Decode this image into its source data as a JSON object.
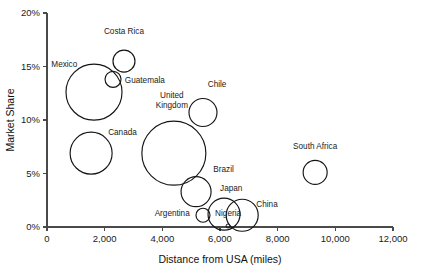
{
  "chart_data": {
    "type": "scatter",
    "variant": "bubble",
    "title": "",
    "xlabel": "Distance from USA (miles)",
    "ylabel": "Market Share",
    "xlim": [
      0,
      12000
    ],
    "ylim": [
      0,
      20
    ],
    "grid": false,
    "legend": "none",
    "x_ticks": [
      0,
      2000,
      4000,
      6000,
      8000,
      10000,
      12000
    ],
    "x_tick_labels": [
      "0",
      "2,000",
      "4,000",
      "6,000",
      "8,000",
      "10,000",
      "12,000"
    ],
    "y_ticks": [
      0,
      5,
      10,
      15,
      20
    ],
    "y_tick_labels": [
      "0%",
      "5%",
      "10%",
      "15%",
      "20%"
    ],
    "y_unit": "%",
    "points": [
      {
        "name": "Mexico",
        "x": 1630,
        "y": 12.6,
        "r_px": 28,
        "label_x": 1050,
        "label_y": 15.0,
        "anchor": "end",
        "lines": [
          "Mexico"
        ]
      },
      {
        "name": "Costa Rica",
        "x": 2670,
        "y": 15.5,
        "r_px": 11,
        "label_x": 2670,
        "label_y": 18.0,
        "anchor": "middle",
        "lines": [
          "Costa Rica"
        ]
      },
      {
        "name": "Guatemala",
        "x": 2290,
        "y": 13.8,
        "r_px": 8,
        "label_x": 2700,
        "label_y": 13.5,
        "anchor": "start",
        "lines": [
          "Guatemala"
        ]
      },
      {
        "name": "Canada",
        "x": 1530,
        "y": 6.9,
        "r_px": 21,
        "label_x": 2120,
        "label_y": 8.6,
        "anchor": "start",
        "lines": [
          "Canada"
        ]
      },
      {
        "name": "United Kingdom",
        "x": 4400,
        "y": 6.9,
        "r_px": 32,
        "label_x": 4330,
        "label_y": 12.1,
        "anchor": "middle",
        "lines": [
          "United",
          "Kingdom"
        ]
      },
      {
        "name": "Chile",
        "x": 5410,
        "y": 10.7,
        "r_px": 14,
        "label_x": 5900,
        "label_y": 13.1,
        "anchor": "middle",
        "lines": [
          "Chile"
        ]
      },
      {
        "name": "Brazil",
        "x": 5170,
        "y": 3.3,
        "r_px": 15,
        "label_x": 5770,
        "label_y": 5.1,
        "anchor": "start",
        "lines": [
          "Brazil"
        ]
      },
      {
        "name": "Argentina",
        "x": 5410,
        "y": 1.1,
        "r_px": 7,
        "label_x": 4950,
        "label_y": 1.0,
        "anchor": "end",
        "lines": [
          "Argentina"
        ]
      },
      {
        "name": "Japan",
        "x": 6140,
        "y": 1.2,
        "r_px": 16,
        "label_x": 6390,
        "label_y": 3.4,
        "anchor": "middle",
        "lines": [
          "Japan"
        ]
      },
      {
        "name": "Nigeria",
        "x": 6280,
        "y": 0.1,
        "r_px": 2,
        "label_x": 6280,
        "label_y": 1.0,
        "anchor": "middle",
        "lines": [
          "Nigeria"
        ]
      },
      {
        "name": "China",
        "x": 6770,
        "y": 1.1,
        "r_px": 16,
        "label_x": 7260,
        "label_y": 1.9,
        "anchor": "start",
        "lines": [
          "China"
        ]
      },
      {
        "name": "South Africa",
        "x": 9300,
        "y": 5.1,
        "r_px": 12,
        "label_x": 9300,
        "label_y": 7.3,
        "anchor": "middle",
        "lines": [
          "South Africa"
        ]
      }
    ]
  },
  "colors": {
    "bubble_stroke": "#141414",
    "axis": "#4a4a4a",
    "text": "#1a1a1a",
    "background": "#ffffff"
  }
}
